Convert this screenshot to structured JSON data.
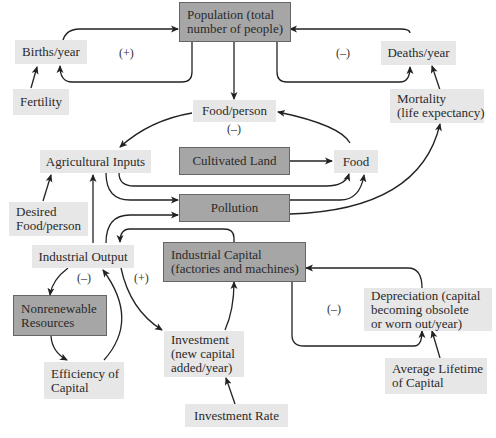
{
  "nodes": {
    "population": "Population (total number of people)",
    "population_l1": "Population (total",
    "population_l2": "number of people)",
    "births": "Births/year",
    "deaths": "Deaths/year",
    "fertility": "Fertility",
    "food_person": "Food/person",
    "mortality_l1": "Mortality",
    "mortality_l2": "(life expectancy)",
    "agricultural_inputs": "Agricultural Inputs",
    "cultivated_land": "Cultivated Land",
    "food": "Food",
    "desired_l1": "Desired",
    "desired_l2": "Food/person",
    "pollution": "Pollution",
    "industrial_output": "Industrial Output",
    "capital_l1": "Industrial Capital",
    "capital_l2": "(factories and machines)",
    "nonrenew_l1": "Nonrenewable",
    "nonrenew_l2": "Resources",
    "depr_l1": "Depreciation (capital",
    "depr_l2": "becoming obsolete",
    "depr_l3": "or worn out/year)",
    "efficiency_l1": "Efficiency of",
    "efficiency_l2": "Capital",
    "investment_l1": "Investment",
    "investment_l2": "(new capital",
    "investment_l3": "added/year)",
    "lifetime_l1": "Average Lifetime",
    "lifetime_l2": "of Capital",
    "investment_rate": "Investment Rate"
  },
  "loop_labels": {
    "births_loop": "(+)",
    "deaths_loop": "(–)",
    "food_person_loop": "(–)",
    "resources_loop": "(–)",
    "investment_loop": "(+)",
    "depreciation_loop": "(–)"
  },
  "colors": {
    "stock_box": "#a6a6a6",
    "variable_box": "#e7e7e7",
    "arrow": "#222222"
  }
}
